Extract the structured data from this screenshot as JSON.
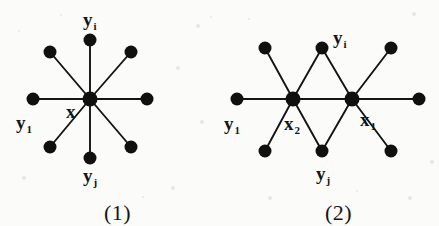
{
  "figure": {
    "background_color": "#fbfbfa",
    "ink_color": "#141414",
    "width": 439,
    "height": 226
  },
  "diagrams": [
    {
      "id": "diagram-1",
      "caption": "(1)",
      "caption_pos": [
        104,
        202
      ],
      "type": "star-graph",
      "hub": {
        "label": "x",
        "cx": 90,
        "cy": 99,
        "r": 7.5
      },
      "hub_label_pos": [
        68,
        118
      ],
      "leaves": [
        {
          "name": "leaf-top",
          "cx": 90,
          "cy": 40,
          "r": 6.5
        },
        {
          "name": "leaf-top-right",
          "cx": 131,
          "cy": 52,
          "r": 6.5
        },
        {
          "name": "leaf-right",
          "cx": 147,
          "cy": 99,
          "r": 6.5
        },
        {
          "name": "leaf-bottom-right",
          "cx": 131,
          "cy": 147,
          "r": 6.5
        },
        {
          "name": "leaf-bottom",
          "cx": 90,
          "cy": 158,
          "r": 6.5
        },
        {
          "name": "leaf-bottom-left",
          "cx": 50,
          "cy": 147,
          "r": 6.5
        },
        {
          "name": "leaf-left",
          "cx": 33,
          "cy": 99,
          "r": 6.5
        },
        {
          "name": "leaf-top-left",
          "cx": 50,
          "cy": 52,
          "r": 6.5
        }
      ],
      "labels": [
        {
          "name": "label-yi",
          "base": "y",
          "sub": "i",
          "x": 83,
          "y": 10,
          "anchor": "left"
        },
        {
          "name": "label-y1",
          "base": "y",
          "sub": "1",
          "x": 16,
          "y": 113,
          "anchor": "left"
        },
        {
          "name": "label-x",
          "base": "x",
          "sub": "",
          "x": 66,
          "y": 102,
          "anchor": "left"
        },
        {
          "name": "label-yj",
          "base": "y",
          "sub": "j",
          "x": 83,
          "y": 166,
          "anchor": "left"
        }
      ]
    },
    {
      "id": "diagram-2",
      "caption": "(2)",
      "caption_pos": [
        325,
        202
      ],
      "type": "double-star-graph",
      "hubs": [
        {
          "label": "x2",
          "name": "hub-x2",
          "cx": 293,
          "cy": 99,
          "r": 7.5
        },
        {
          "label": "x1",
          "name": "hub-x1",
          "cx": 352,
          "cy": 99,
          "r": 7.5
        }
      ],
      "nodes": [
        {
          "name": "node-far-left",
          "cx": 237,
          "cy": 99,
          "r": 6.5
        },
        {
          "name": "node-upper-left",
          "cx": 265,
          "cy": 48,
          "r": 6.5
        },
        {
          "name": "node-lower-left",
          "cx": 265,
          "cy": 151,
          "r": 6.5
        },
        {
          "name": "node-top-middle",
          "cx": 322,
          "cy": 48,
          "r": 6.5
        },
        {
          "name": "node-bottom-middle",
          "cx": 322,
          "cy": 151,
          "r": 6.5
        },
        {
          "name": "node-upper-right",
          "cx": 391,
          "cy": 48,
          "r": 6.5
        },
        {
          "name": "node-lower-right",
          "cx": 391,
          "cy": 151,
          "r": 6.5
        },
        {
          "name": "node-far-right",
          "cx": 419,
          "cy": 99,
          "r": 6.5
        }
      ],
      "edges": [
        [
          "node-far-left",
          "hub-x2"
        ],
        [
          "node-upper-left",
          "hub-x2"
        ],
        [
          "node-lower-left",
          "hub-x2"
        ],
        [
          "hub-x2",
          "node-top-middle"
        ],
        [
          "hub-x2",
          "node-bottom-middle"
        ],
        [
          "hub-x2",
          "hub-x1"
        ],
        [
          "node-top-middle",
          "hub-x1"
        ],
        [
          "node-bottom-middle",
          "hub-x1"
        ],
        [
          "hub-x1",
          "node-upper-right"
        ],
        [
          "hub-x1",
          "node-lower-right"
        ],
        [
          "hub-x1",
          "node-far-right"
        ]
      ],
      "labels": [
        {
          "name": "label-yi",
          "base": "y",
          "sub": "i",
          "x": 333,
          "y": 28,
          "anchor": "left"
        },
        {
          "name": "label-y1",
          "base": "y",
          "sub": "1",
          "x": 224,
          "y": 114,
          "anchor": "left"
        },
        {
          "name": "label-x2",
          "base": "x",
          "sub": "2",
          "x": 284,
          "y": 114,
          "anchor": "left"
        },
        {
          "name": "label-x1",
          "base": "x",
          "sub": "1",
          "x": 360,
          "y": 110,
          "anchor": "left"
        },
        {
          "name": "label-yj",
          "base": "y",
          "sub": "j",
          "x": 316,
          "y": 164,
          "anchor": "left"
        }
      ]
    }
  ]
}
